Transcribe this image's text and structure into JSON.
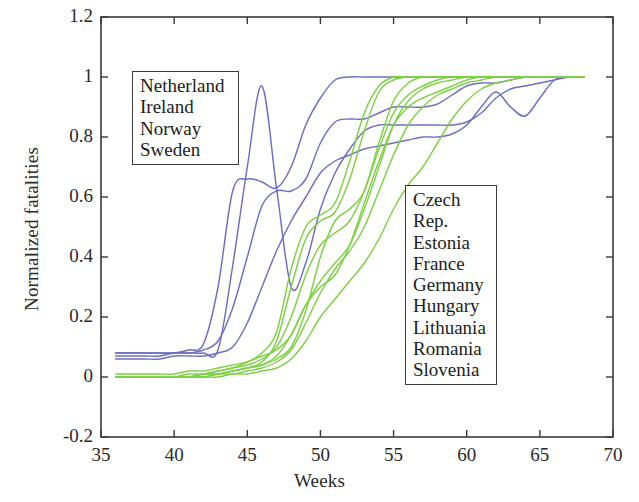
{
  "chart_data": {
    "type": "line",
    "title": "",
    "xlabel": "Weeks",
    "ylabel": "Normalized fatalities",
    "xlim": [
      35,
      70
    ],
    "ylim": [
      -0.2,
      1.2
    ],
    "xticks": [
      35,
      40,
      45,
      50,
      55,
      60,
      65,
      70
    ],
    "yticks": [
      -0.2,
      0,
      0.2,
      0.4,
      0.6,
      0.8,
      1,
      1.2
    ],
    "xtick_labels": [
      "35",
      "40",
      "45",
      "50",
      "55",
      "60",
      "65",
      "70"
    ],
    "ytick_labels": [
      "-0.2",
      "0",
      "0.2",
      "0.4",
      "0.6",
      "0.8",
      "1",
      "1.2"
    ],
    "grid": false,
    "legend_position": "inside-two-boxes",
    "group_colors": {
      "north_west": "#6f6fc0",
      "central_east": "#7fd046"
    },
    "groups": [
      {
        "name": "north_west",
        "color": "#6f6fc0",
        "members": [
          "Netherland",
          "Ireland",
          "Norway",
          "Sweden"
        ],
        "series": [
          {
            "name": "Netherland",
            "x": [
              36,
              37,
              38,
              39,
              40,
              41,
              42,
              43,
              44,
              45,
              46,
              47,
              48,
              49,
              50,
              51,
              52,
              53,
              54,
              55,
              56,
              57,
              58,
              59,
              60,
              61,
              62,
              63,
              64,
              65,
              66,
              67,
              68
            ],
            "y": [
              0.08,
              0.08,
              0.08,
              0.08,
              0.08,
              0.09,
              0.11,
              0.3,
              0.62,
              0.66,
              0.65,
              0.63,
              0.7,
              0.84,
              0.93,
              0.99,
              1.0,
              1.0,
              1.0,
              1.0,
              1.0,
              1.0,
              1.0,
              1.0,
              1.0,
              1.0,
              1.0,
              1.0,
              1.0,
              1.0,
              1.0,
              1.0,
              1.0
            ]
          },
          {
            "name": "Ireland",
            "x": [
              36,
              37,
              38,
              39,
              40,
              41,
              42,
              43,
              44,
              45,
              46,
              47,
              48,
              49,
              50,
              51,
              52,
              53,
              54,
              55,
              56,
              57,
              58,
              59,
              60,
              61,
              62,
              63,
              64,
              65,
              66,
              67,
              68
            ],
            "y": [
              0.07,
              0.07,
              0.07,
              0.07,
              0.08,
              0.08,
              0.08,
              0.09,
              0.37,
              0.7,
              0.97,
              0.63,
              0.3,
              0.38,
              0.56,
              0.68,
              0.76,
              0.82,
              0.84,
              0.84,
              0.84,
              0.84,
              0.84,
              0.84,
              0.85,
              0.88,
              0.93,
              0.96,
              0.97,
              0.98,
              0.99,
              1.0,
              1.0
            ]
          },
          {
            "name": "Norway",
            "x": [
              36,
              37,
              38,
              39,
              40,
              41,
              42,
              43,
              44,
              45,
              46,
              47,
              48,
              49,
              50,
              51,
              52,
              53,
              54,
              55,
              56,
              57,
              58,
              59,
              60,
              61,
              62,
              63,
              64,
              65,
              66,
              67,
              68
            ],
            "y": [
              0.08,
              0.08,
              0.08,
              0.08,
              0.08,
              0.08,
              0.09,
              0.12,
              0.23,
              0.4,
              0.57,
              0.62,
              0.62,
              0.66,
              0.78,
              0.85,
              0.86,
              0.86,
              0.88,
              0.9,
              0.9,
              0.9,
              0.91,
              0.94,
              0.97,
              0.98,
              0.98,
              0.99,
              1.0,
              1.0,
              1.0,
              1.0,
              1.0
            ]
          },
          {
            "name": "Sweden",
            "x": [
              36,
              37,
              38,
              39,
              40,
              41,
              42,
              43,
              44,
              45,
              46,
              47,
              48,
              49,
              50,
              51,
              52,
              53,
              54,
              55,
              56,
              57,
              58,
              59,
              60,
              61,
              62,
              63,
              64,
              65,
              66,
              67,
              68
            ],
            "y": [
              0.06,
              0.06,
              0.06,
              0.06,
              0.07,
              0.07,
              0.07,
              0.08,
              0.1,
              0.18,
              0.3,
              0.42,
              0.52,
              0.6,
              0.68,
              0.72,
              0.74,
              0.76,
              0.77,
              0.78,
              0.79,
              0.8,
              0.8,
              0.81,
              0.84,
              0.9,
              0.95,
              0.9,
              0.87,
              0.93,
              0.99,
              1.0,
              1.0
            ]
          }
        ]
      },
      {
        "name": "central_east",
        "color": "#7fd046",
        "members": [
          "Czech Rep.",
          "Estonia",
          "France",
          "Germany",
          "Hungary",
          "Lithuania",
          "Romania",
          "Slovenia"
        ],
        "series": [
          {
            "name": "Czech Rep.",
            "x": [
              36,
              37,
              38,
              39,
              40,
              41,
              42,
              43,
              44,
              45,
              46,
              47,
              48,
              49,
              50,
              51,
              52,
              53,
              54,
              55,
              56,
              57,
              58,
              59,
              60,
              61,
              62,
              63,
              64,
              65,
              66,
              67,
              68
            ],
            "y": [
              0.0,
              0.0,
              0.0,
              0.0,
              0.0,
              0.0,
              0.01,
              0.01,
              0.02,
              0.03,
              0.05,
              0.12,
              0.3,
              0.46,
              0.52,
              0.55,
              0.66,
              0.82,
              0.95,
              0.99,
              1.0,
              1.0,
              1.0,
              1.0,
              1.0,
              1.0,
              1.0,
              1.0,
              1.0,
              1.0,
              1.0,
              1.0,
              1.0
            ]
          },
          {
            "name": "Estonia",
            "x": [
              36,
              37,
              38,
              39,
              40,
              41,
              42,
              43,
              44,
              45,
              46,
              47,
              48,
              49,
              50,
              51,
              52,
              53,
              54,
              55,
              56,
              57,
              58,
              59,
              60,
              61,
              62,
              63,
              64,
              65,
              66,
              67,
              68
            ],
            "y": [
              0.0,
              0.0,
              0.0,
              0.0,
              0.0,
              0.0,
              0.0,
              0.01,
              0.02,
              0.03,
              0.04,
              0.06,
              0.1,
              0.22,
              0.4,
              0.52,
              0.56,
              0.62,
              0.78,
              0.92,
              0.98,
              1.0,
              1.0,
              1.0,
              1.0,
              1.0,
              1.0,
              1.0,
              1.0,
              1.0,
              1.0,
              1.0,
              1.0
            ]
          },
          {
            "name": "France",
            "x": [
              36,
              37,
              38,
              39,
              40,
              41,
              42,
              43,
              44,
              45,
              46,
              47,
              48,
              49,
              50,
              51,
              52,
              53,
              54,
              55,
              56,
              57,
              58,
              59,
              60,
              61,
              62,
              63,
              64,
              65,
              66,
              67,
              68
            ],
            "y": [
              0.01,
              0.01,
              0.01,
              0.01,
              0.01,
              0.02,
              0.02,
              0.03,
              0.04,
              0.05,
              0.07,
              0.09,
              0.14,
              0.24,
              0.32,
              0.38,
              0.44,
              0.56,
              0.7,
              0.84,
              0.92,
              0.96,
              0.98,
              0.99,
              1.0,
              1.0,
              1.0,
              1.0,
              1.0,
              1.0,
              1.0,
              1.0,
              1.0
            ]
          },
          {
            "name": "Germany",
            "x": [
              36,
              37,
              38,
              39,
              40,
              41,
              42,
              43,
              44,
              45,
              46,
              47,
              48,
              49,
              50,
              51,
              52,
              53,
              54,
              55,
              56,
              57,
              58,
              59,
              60,
              61,
              62,
              63,
              64,
              65,
              66,
              67,
              68
            ],
            "y": [
              0.0,
              0.0,
              0.0,
              0.0,
              0.0,
              0.01,
              0.01,
              0.02,
              0.03,
              0.04,
              0.06,
              0.1,
              0.2,
              0.34,
              0.44,
              0.48,
              0.52,
              0.62,
              0.76,
              0.88,
              0.94,
              0.97,
              0.99,
              1.0,
              1.0,
              1.0,
              1.0,
              1.0,
              1.0,
              1.0,
              1.0,
              1.0,
              1.0
            ]
          },
          {
            "name": "Hungary",
            "x": [
              36,
              37,
              38,
              39,
              40,
              41,
              42,
              43,
              44,
              45,
              46,
              47,
              48,
              49,
              50,
              51,
              52,
              53,
              54,
              55,
              56,
              57,
              58,
              59,
              60,
              61,
              62,
              63,
              64,
              65,
              66,
              67,
              68
            ],
            "y": [
              0.0,
              0.0,
              0.0,
              0.0,
              0.0,
              0.0,
              0.01,
              0.01,
              0.02,
              0.03,
              0.04,
              0.07,
              0.14,
              0.24,
              0.3,
              0.34,
              0.44,
              0.58,
              0.72,
              0.84,
              0.9,
              0.93,
              0.95,
              0.97,
              0.99,
              1.0,
              1.0,
              1.0,
              1.0,
              1.0,
              1.0,
              1.0,
              1.0
            ]
          },
          {
            "name": "Lithuania",
            "x": [
              36,
              37,
              38,
              39,
              40,
              41,
              42,
              43,
              44,
              45,
              46,
              47,
              48,
              49,
              50,
              51,
              52,
              53,
              54,
              55,
              56,
              57,
              58,
              59,
              60,
              61,
              62,
              63,
              64,
              65,
              66,
              67,
              68
            ],
            "y": [
              0.0,
              0.0,
              0.0,
              0.0,
              0.0,
              0.0,
              0.0,
              0.01,
              0.01,
              0.02,
              0.03,
              0.05,
              0.09,
              0.18,
              0.28,
              0.36,
              0.42,
              0.5,
              0.62,
              0.74,
              0.84,
              0.9,
              0.94,
              0.96,
              0.98,
              0.99,
              1.0,
              1.0,
              1.0,
              1.0,
              1.0,
              1.0,
              1.0
            ]
          },
          {
            "name": "Romania",
            "x": [
              36,
              37,
              38,
              39,
              40,
              41,
              42,
              43,
              44,
              45,
              46,
              47,
              48,
              49,
              50,
              51,
              52,
              53,
              54,
              55,
              56,
              57,
              58,
              59,
              60,
              61,
              62,
              63,
              64,
              65,
              66,
              67,
              68
            ],
            "y": [
              0.0,
              0.0,
              0.0,
              0.0,
              0.0,
              0.0,
              0.0,
              0.0,
              0.01,
              0.01,
              0.02,
              0.03,
              0.06,
              0.12,
              0.2,
              0.26,
              0.32,
              0.38,
              0.46,
              0.56,
              0.64,
              0.7,
              0.78,
              0.86,
              0.92,
              0.96,
              0.98,
              0.99,
              1.0,
              1.0,
              1.0,
              1.0,
              1.0
            ]
          },
          {
            "name": "Slovenia",
            "x": [
              36,
              37,
              38,
              39,
              40,
              41,
              42,
              43,
              44,
              45,
              46,
              47,
              48,
              49,
              50,
              51,
              52,
              53,
              54,
              55,
              56,
              57,
              58,
              59,
              60,
              61,
              62,
              63,
              64,
              65,
              66,
              67,
              68
            ],
            "y": [
              0.0,
              0.0,
              0.0,
              0.0,
              0.0,
              0.0,
              0.01,
              0.02,
              0.03,
              0.05,
              0.08,
              0.15,
              0.36,
              0.5,
              0.54,
              0.58,
              0.72,
              0.88,
              0.97,
              1.0,
              1.0,
              1.0,
              1.0,
              1.0,
              1.0,
              1.0,
              1.0,
              1.0,
              1.0,
              1.0,
              1.0,
              1.0,
              1.0
            ]
          }
        ]
      }
    ]
  },
  "legend_north": {
    "items": [
      "Netherland",
      "Ireland",
      "Norway",
      "Sweden"
    ]
  },
  "legend_east": {
    "items": [
      "Czech",
      "Rep.",
      "Estonia",
      "France",
      "Germany",
      "Hungary",
      "Lithuania",
      "Romania",
      "Slovenia"
    ]
  }
}
